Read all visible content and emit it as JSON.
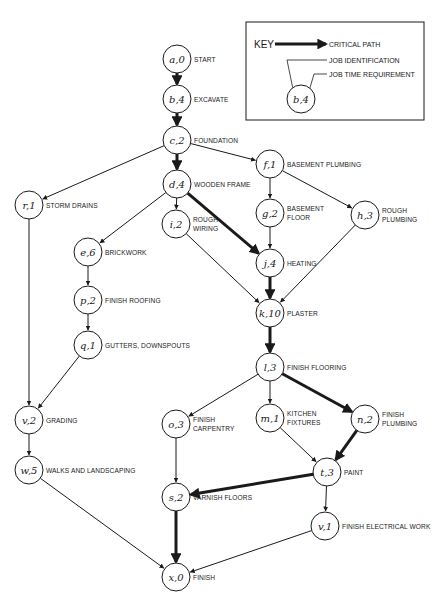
{
  "diagram": {
    "type": "critical-path-network",
    "key": {
      "title": "KEY",
      "critical_path": "CRITICAL PATH",
      "job_identification": "JOB IDENTIFICATION",
      "job_time_requirement": "JOB TIME REQUIREMENT",
      "example_node": "b,4"
    },
    "nodes": [
      {
        "id": "a",
        "label": "a,0",
        "desc": "START",
        "x": 177,
        "y": 59
      },
      {
        "id": "b",
        "label": "b,4",
        "desc": "EXCAVATE",
        "x": 177,
        "y": 99
      },
      {
        "id": "c",
        "label": "c,2",
        "desc": "FOUNDATION",
        "x": 177,
        "y": 140
      },
      {
        "id": "d",
        "label": "d,4",
        "desc": "WOODEN FRAME",
        "x": 177,
        "y": 184
      },
      {
        "id": "f",
        "label": "f,1",
        "desc": "BASEMENT PLUMBING",
        "x": 270,
        "y": 164
      },
      {
        "id": "r",
        "label": "r,1",
        "desc": "STORM DRAINS",
        "x": 29,
        "y": 205
      },
      {
        "id": "i",
        "label": "i,2",
        "desc": "ROUGH|WIRING",
        "x": 176,
        "y": 224
      },
      {
        "id": "g",
        "label": "g,2",
        "desc": "BASEMENT|FLOOR",
        "x": 270,
        "y": 213
      },
      {
        "id": "h",
        "label": "h,3",
        "desc": "ROUGH|PLUMBING",
        "x": 365,
        "y": 215
      },
      {
        "id": "e",
        "label": "e,6",
        "desc": "BRICKWORK",
        "x": 88,
        "y": 252
      },
      {
        "id": "j",
        "label": "j,4",
        "desc": "HEATING",
        "x": 270,
        "y": 263
      },
      {
        "id": "p",
        "label": "p,2",
        "desc": "FINISH ROOFING",
        "x": 88,
        "y": 300
      },
      {
        "id": "k",
        "label": "k,10",
        "desc": "PLASTER",
        "x": 270,
        "y": 313
      },
      {
        "id": "q",
        "label": "q,1",
        "desc": "GUTTERS, DOWNSPOUTS",
        "x": 88,
        "y": 345
      },
      {
        "id": "l",
        "label": "l,3",
        "desc": "FINISH FLOORING",
        "x": 270,
        "y": 367
      },
      {
        "id": "v",
        "label": "v,2",
        "desc": "GRADING",
        "x": 29,
        "y": 420
      },
      {
        "id": "o",
        "label": "o,3",
        "desc": "FINISH|CARPENTRY",
        "x": 176,
        "y": 424
      },
      {
        "id": "m",
        "label": "m,1",
        "desc": "KITCHEN|FIXTURES",
        "x": 270,
        "y": 418
      },
      {
        "id": "n",
        "label": "n,2",
        "desc": "FINISH|PLUMBING",
        "x": 365,
        "y": 419
      },
      {
        "id": "w",
        "label": "w,5",
        "desc": "WALKS AND LANDSCAPING",
        "x": 29,
        "y": 470
      },
      {
        "id": "t",
        "label": "t,3",
        "desc": "PAINT",
        "x": 327,
        "y": 472
      },
      {
        "id": "s",
        "label": "s,2",
        "desc": "VARNISH FLOORS",
        "x": 176,
        "y": 497
      },
      {
        "id": "u",
        "label": "v,1",
        "desc": "FINISH ELECTRICAL WORK",
        "x": 325,
        "y": 526
      },
      {
        "id": "x",
        "label": "x,0",
        "desc": "FINISH",
        "x": 176,
        "y": 577
      }
    ],
    "edges": [
      {
        "from": "a",
        "to": "b",
        "critical": true
      },
      {
        "from": "b",
        "to": "c",
        "critical": true
      },
      {
        "from": "c",
        "to": "d",
        "critical": true
      },
      {
        "from": "c",
        "to": "f",
        "critical": false
      },
      {
        "from": "c",
        "to": "r",
        "critical": false
      },
      {
        "from": "d",
        "to": "i",
        "critical": false
      },
      {
        "from": "d",
        "to": "e",
        "critical": false
      },
      {
        "from": "d",
        "to": "j",
        "critical": true
      },
      {
        "from": "f",
        "to": "g",
        "critical": false
      },
      {
        "from": "f",
        "to": "h",
        "critical": false
      },
      {
        "from": "g",
        "to": "j",
        "critical": false
      },
      {
        "from": "i",
        "to": "k",
        "critical": false
      },
      {
        "from": "h",
        "to": "k",
        "critical": false
      },
      {
        "from": "j",
        "to": "k",
        "critical": true
      },
      {
        "from": "k",
        "to": "l",
        "critical": true
      },
      {
        "from": "e",
        "to": "p",
        "critical": false
      },
      {
        "from": "p",
        "to": "q",
        "critical": false
      },
      {
        "from": "q",
        "to": "v",
        "critical": false
      },
      {
        "from": "r",
        "to": "v",
        "critical": false
      },
      {
        "from": "v",
        "to": "w",
        "critical": false
      },
      {
        "from": "l",
        "to": "o",
        "critical": false
      },
      {
        "from": "l",
        "to": "m",
        "critical": false
      },
      {
        "from": "l",
        "to": "n",
        "critical": true
      },
      {
        "from": "m",
        "to": "t",
        "critical": false
      },
      {
        "from": "n",
        "to": "t",
        "critical": true
      },
      {
        "from": "o",
        "to": "s",
        "critical": false
      },
      {
        "from": "t",
        "to": "s",
        "critical": true
      },
      {
        "from": "t",
        "to": "u",
        "critical": false
      },
      {
        "from": "s",
        "to": "x",
        "critical": true
      },
      {
        "from": "w",
        "to": "x",
        "critical": false
      },
      {
        "from": "u",
        "to": "x",
        "critical": false
      }
    ]
  }
}
